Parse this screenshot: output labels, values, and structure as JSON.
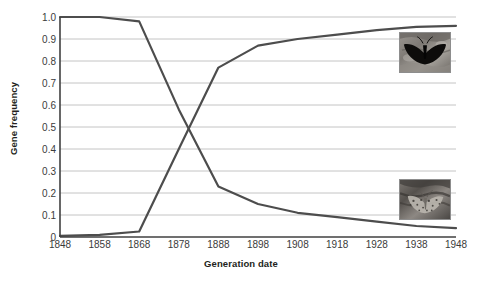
{
  "chart_data": {
    "type": "line",
    "title": "",
    "xlabel": "Generation date",
    "ylabel": "Gene frequency",
    "xlim": [
      1848,
      1948
    ],
    "ylim": [
      0,
      1.0
    ],
    "grid": true,
    "legend": "none",
    "x": [
      1848,
      1858,
      1868,
      1878,
      1888,
      1898,
      1908,
      1918,
      1928,
      1938,
      1948
    ],
    "xtick_labels": [
      "1848",
      "1858",
      "1868",
      "1878",
      "1888",
      "1898",
      "1908",
      "1918",
      "1928",
      "1938",
      "1948"
    ],
    "ytick_labels": [
      "0",
      "0.1",
      "0.2",
      "0.3",
      "0.4",
      "0.5",
      "0.6",
      "0.7",
      "0.8",
      "0.9",
      "1.0"
    ],
    "ytick_values": [
      0,
      0.1,
      0.2,
      0.3,
      0.4,
      0.5,
      0.6,
      0.7,
      0.8,
      0.9,
      1.0
    ],
    "series": [
      {
        "name": "typica (light) allele frequency",
        "color": "#4d4d4d",
        "values": [
          1.0,
          1.0,
          0.98,
          0.58,
          0.23,
          0.15,
          0.11,
          0.09,
          0.07,
          0.05,
          0.04
        ]
      },
      {
        "name": "carbonaria (melanic) allele frequency",
        "color": "#4d4d4d",
        "values": [
          0.005,
          0.01,
          0.025,
          0.4,
          0.77,
          0.87,
          0.9,
          0.92,
          0.94,
          0.955,
          0.96
        ]
      }
    ],
    "annotations": [
      {
        "name": "melanic-moth-photo",
        "description": "Dark melanic peppered moth on soot-darkened lichen-free bark",
        "x_range": [
          1936,
          1949
        ],
        "y_range": [
          0.8,
          0.99
        ]
      },
      {
        "name": "typica-moth-photo",
        "description": "Pale speckled peppered moth camouflaged on lichen-covered bark",
        "x_range": [
          1936,
          1949
        ],
        "y_range": [
          0.08,
          0.27
        ]
      }
    ]
  },
  "colors": {
    "line": "#4d4d4d",
    "grid": "#c4c4c4",
    "axis": "#404040",
    "text": "#3b3b3b",
    "title_text": "#231f20",
    "background": "#ffffff"
  }
}
